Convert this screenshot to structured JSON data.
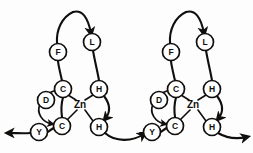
{
  "figure": {
    "background_color": "#fdfdfd",
    "stroke_color": "#100f0d",
    "node_fill": "#ffffff",
    "width": 253,
    "height": 153
  },
  "units": [
    {
      "id": "unit-left",
      "metal": {
        "label": "Zn",
        "x": 80,
        "y": 104
      },
      "residues": [
        {
          "id": "L-F",
          "label": "F",
          "x": 58,
          "y": 52,
          "r": 8.5
        },
        {
          "id": "L-L",
          "label": "L",
          "x": 92,
          "y": 42,
          "r": 8.5
        },
        {
          "id": "L-C1",
          "label": "C",
          "x": 63,
          "y": 89,
          "r": 8.5
        },
        {
          "id": "L-D",
          "label": "D",
          "x": 46,
          "y": 100,
          "r": 8.5
        },
        {
          "id": "L-C2",
          "label": "C",
          "x": 62,
          "y": 126,
          "r": 8.5
        },
        {
          "id": "L-Y",
          "label": "Y",
          "x": 39,
          "y": 132,
          "r": 8.5
        },
        {
          "id": "L-H1",
          "label": "H",
          "x": 99,
          "y": 89,
          "r": 8.5
        },
        {
          "id": "L-H2",
          "label": "H",
          "x": 99,
          "y": 127,
          "r": 8.5
        }
      ]
    },
    {
      "id": "unit-right",
      "metal": {
        "label": "Zn",
        "x": 193,
        "y": 104
      },
      "residues": [
        {
          "id": "R-F",
          "label": "F",
          "x": 171,
          "y": 52,
          "r": 8.5
        },
        {
          "id": "R-L",
          "label": "L",
          "x": 205,
          "y": 42,
          "r": 8.5
        },
        {
          "id": "R-C1",
          "label": "C",
          "x": 176,
          "y": 89,
          "r": 8.5
        },
        {
          "id": "R-D",
          "label": "D",
          "x": 159,
          "y": 100,
          "r": 8.5
        },
        {
          "id": "R-C2",
          "label": "C",
          "x": 175,
          "y": 126,
          "r": 8.5
        },
        {
          "id": "R-Y",
          "label": "Y",
          "x": 152,
          "y": 132,
          "r": 8.5
        },
        {
          "id": "R-H1",
          "label": "H",
          "x": 212,
          "y": 89,
          "r": 8.5
        },
        {
          "id": "R-H2",
          "label": "H",
          "x": 212,
          "y": 127,
          "r": 8.5
        }
      ]
    }
  ],
  "connectors": {
    "left_terminus_arrow": "arrow-out-left",
    "middle_link_arrow": "arrow-right-mid",
    "right_terminus_arrow": "arrow-out-right",
    "loop_apex_arrow_left": "arrow-apex-left",
    "loop_apex_arrow_right": "arrow-apex-right"
  }
}
